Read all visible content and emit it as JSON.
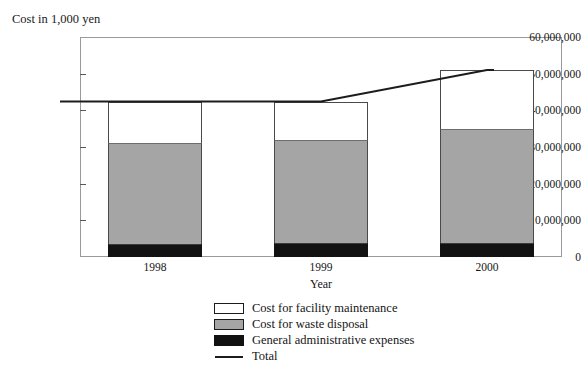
{
  "figure": {
    "cut_off_header_text": "",
    "axis_title_y": "Cost in 1,000 yen",
    "axis_title_x": "Year"
  },
  "yaxis": {
    "ticks": [
      "60,000,000",
      "50,000,000",
      "40,000,000",
      "30,000,000",
      "20,000,000",
      "10,000,000",
      "0"
    ]
  },
  "xaxis": {
    "ticks": [
      "1998",
      "1999",
      "2000"
    ]
  },
  "legend": {
    "items": [
      {
        "label": "Cost for facility maintenance",
        "swatch": "white-square-icon"
      },
      {
        "label": "Cost for waste disposal",
        "swatch": "gray-square-icon"
      },
      {
        "label": "General administrative expenses",
        "swatch": "black-square-icon"
      },
      {
        "label": "Total",
        "swatch": "line-marker-icon"
      }
    ]
  },
  "chart_data": {
    "type": "bar",
    "title": "",
    "subtitle": "",
    "xlabel": "Year",
    "ylabel": "Cost in 1,000 yen",
    "categories": [
      "1998",
      "1999",
      "2000"
    ],
    "ylim": [
      0,
      60000000
    ],
    "ytick_values": [
      0,
      10000000,
      20000000,
      30000000,
      40000000,
      50000000,
      60000000
    ],
    "grid": false,
    "stacked": true,
    "legend_position": "bottom-center",
    "series": [
      {
        "name": "General administrative expenses",
        "color": "#121212",
        "values": [
          3600000,
          3800000,
          3800000
        ]
      },
      {
        "name": "Cost for waste disposal",
        "color": "#a5a5a5",
        "values": [
          27400000,
          28000000,
          31000000
        ]
      },
      {
        "name": "Cost for facility maintenance",
        "color": "#ffffff",
        "values": [
          11400000,
          10600000,
          16200000
        ]
      }
    ],
    "overlay_series": [
      {
        "name": "Total",
        "type": "line",
        "color": "#1c1c1c",
        "values": [
          42400000,
          42400000,
          51000000
        ]
      }
    ]
  },
  "colors": {
    "facility_maintenance": "#ffffff",
    "waste_disposal": "#a5a5a5",
    "administrative": "#121212",
    "total_line": "#1c1c1c",
    "frame": "#9a9a9a"
  }
}
